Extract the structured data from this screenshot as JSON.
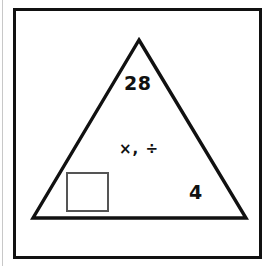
{
  "diagram": {
    "type": "number-triangle",
    "frame": {
      "shape": "rectangle",
      "stroke_color": "#111111"
    },
    "triangle": {
      "stroke_color": "#111111",
      "apex": {
        "x": 139,
        "y": 40
      },
      "bottom_left": {
        "x": 33,
        "y": 218
      },
      "bottom_right": {
        "x": 246,
        "y": 218
      }
    },
    "labels": {
      "top_number": "28",
      "operations": "×, ÷",
      "bottom_number": "4"
    },
    "answer_box": {
      "value": "",
      "placeholder": "",
      "border_color": "#555555"
    }
  }
}
